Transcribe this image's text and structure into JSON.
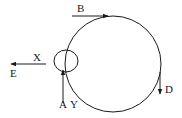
{
  "diagram": {
    "labels": {
      "B": "B",
      "X": "X",
      "E": "E",
      "A": "A",
      "Y": "Y",
      "D": "D"
    },
    "colors": {
      "stroke": "#1a1a1a",
      "background": "#ffffff"
    }
  }
}
